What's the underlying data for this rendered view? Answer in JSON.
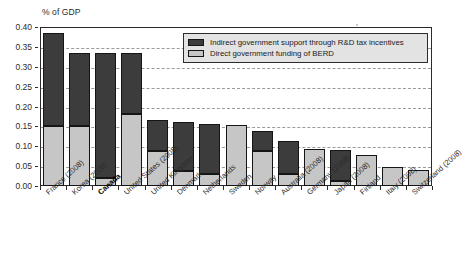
{
  "chart_data": {
    "type": "bar",
    "title": "",
    "ylabel": "% of GDP",
    "xlabel": "",
    "ylim": [
      0,
      0.4
    ],
    "ytick_values": [
      0.0,
      0.05,
      0.1,
      0.15,
      0.2,
      0.25,
      0.3,
      0.35,
      0.4
    ],
    "ytick_labels": [
      "0.00",
      "0.05",
      "0.10",
      "0.15",
      "0.20",
      "0.25",
      "0.30",
      "0.35",
      "0.40"
    ],
    "grid": true,
    "stacked": true,
    "legend_position": "top-right-inside",
    "categories": [
      "France (2008)",
      "Korea (2008)",
      "Canada",
      "United States (2008)",
      "United Kingdom",
      "Denmark",
      "Netherlands",
      "Sweden",
      "Norway",
      "Australia (2008)",
      "Germany (2008)",
      "Japan (2008)",
      "Finland",
      "Italy (2008)",
      "Switzerland (2008)"
    ],
    "highlighted_category": "Canada",
    "series": [
      {
        "name": "Direct government funding of BERD",
        "color": "#c6c6c6",
        "values": [
          0.15,
          0.15,
          0.021,
          0.181,
          0.088,
          0.038,
          0.031,
          0.153,
          0.088,
          0.03,
          0.094,
          0.013,
          0.079,
          0.047,
          0.04
        ]
      },
      {
        "name": "Indirect government support through R&D tax incentives",
        "color": "#3c3c3c",
        "values": [
          0.234,
          0.184,
          0.313,
          0.153,
          0.077,
          0.124,
          0.125,
          0.0,
          0.051,
          0.082,
          0.0,
          0.078,
          0.0,
          0.0,
          0.0
        ]
      }
    ],
    "totals": [
      0.384,
      0.334,
      0.334,
      0.334,
      0.165,
      0.162,
      0.156,
      0.153,
      0.139,
      0.112,
      0.094,
      0.091,
      0.079,
      0.047,
      0.04
    ]
  },
  "legend": {
    "items": [
      {
        "label": "Indirect government support through R&D tax incentives",
        "color": "#3c3c3c"
      },
      {
        "label": "Direct government funding of BERD",
        "color": "#c6c6c6"
      }
    ]
  }
}
